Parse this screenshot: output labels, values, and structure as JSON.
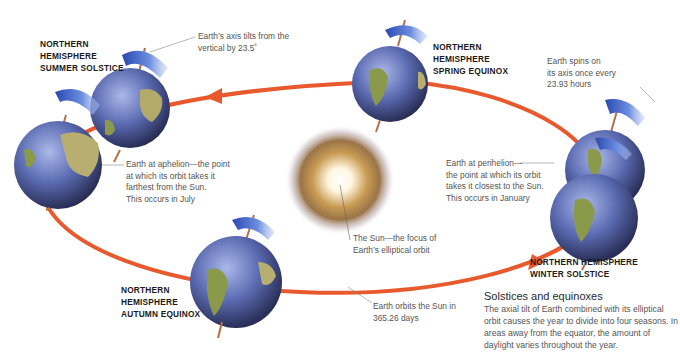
{
  "diagram": {
    "type": "earth-orbit-seasons",
    "colors": {
      "orbit": "#e85a2e",
      "earth_ocean": "#5a6fb8",
      "earth_land": "#8a9a4a",
      "spin_arrow": "#4a6fd0",
      "sun_core": "#ffffff",
      "sun_glow": "#a8823c",
      "axis": "#b5704a"
    },
    "labels": {
      "summer_solstice": "NORTHERN\nHEMISPHERE\nSUMMER SOLSTICE",
      "spring_equinox": "NORTHERN\nHEMISPHERE\nSPRING EQUINOX",
      "autumn_equinox": "NORTHERN\nHEMISPHERE\nAUTUMN EQUINOX",
      "winter_solstice": "NORTHERN HEMISPHERE\nWINTER SOLSTICE"
    },
    "annotations": {
      "axis_tilt": "Earth’s axis tilts from the\nvertical by 23.5˚",
      "spin": "Earth spins on\nits axis once every\n23.93 hours",
      "aphelion": "Earth at aphelion—the point\nat which its orbit takes it\nfarthest from the Sun.\nThis occurs in July",
      "perihelion": "Earth at perihelion—\nthe point at which its orbit\ntakes it closest to the Sun.\nThis occurs in January",
      "sun": "The Sun—the focus of\nEarth’s elliptical orbit",
      "orbit_period": "Earth orbits the Sun in\n365.26 days"
    },
    "info_box": {
      "title": "Solstices and equinoxes",
      "body": "The axial tilt of Earth combined with its elliptical orbit causes the year to divide into four seasons. In areas away from the equator, the amount of daylight varies throughout the year."
    }
  }
}
